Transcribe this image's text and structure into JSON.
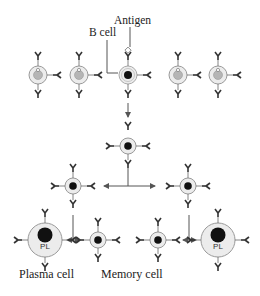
{
  "labels": {
    "antigen": "Antigen",
    "b_cell": "B cell",
    "plasma_cell": "Plasma cell",
    "memory_cell": "Memory cell",
    "pl": "PL"
  },
  "colors": {
    "line": "#555555",
    "cell_fill": "#ececec",
    "cell_stroke": "#9a9a9a",
    "nucleus_inactive": "#b5b5b5",
    "nucleus_active": "#111111",
    "antibody": "#333333"
  },
  "rows": {
    "naive_b_cells": [
      {
        "x": 38,
        "y": 75,
        "active": false
      },
      {
        "x": 79,
        "y": 75,
        "active": false
      },
      {
        "x": 128,
        "y": 75,
        "active": true,
        "antigen_bound": true
      },
      {
        "x": 178,
        "y": 75,
        "active": false
      },
      {
        "x": 218,
        "y": 75,
        "active": false
      }
    ],
    "proliferation_1": [
      {
        "x": 128,
        "y": 146
      }
    ],
    "proliferation_2": [
      {
        "x": 73,
        "y": 186
      },
      {
        "x": 188,
        "y": 186
      }
    ],
    "differentiated": [
      {
        "x": 45,
        "y": 240,
        "type": "plasma"
      },
      {
        "x": 98,
        "y": 240,
        "type": "memory"
      },
      {
        "x": 158,
        "y": 240,
        "type": "memory"
      },
      {
        "x": 218,
        "y": 240,
        "type": "plasma"
      }
    ]
  }
}
